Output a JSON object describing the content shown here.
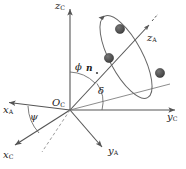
{
  "figure": {
    "kind": "3d-coordinate-frame-diagram",
    "width": 186,
    "height": 169,
    "background": "#ffffff",
    "line_color": "#555555",
    "text_color": "#1a1a1a",
    "sphere_color": "#4d4d4d"
  },
  "origin": {
    "label": "O",
    "subscript": "C",
    "x": 70,
    "y": 110
  },
  "axes": [
    {
      "id": "zc",
      "label": "z",
      "subscript": "C",
      "label_x": 56,
      "label_y": 2,
      "from": [
        70,
        110
      ],
      "to": [
        70,
        6
      ],
      "arrow": true,
      "dashed": false
    },
    {
      "id": "yc",
      "label": "y",
      "subscript": "C",
      "label_x": 167,
      "label_y": 114,
      "from": [
        70,
        110
      ],
      "to": [
        178,
        110
      ],
      "arrow": true,
      "dashed": false
    },
    {
      "id": "xc",
      "label": "x",
      "subscript": "C",
      "label_x": 4,
      "label_y": 154,
      "from": [
        70,
        110
      ],
      "to": [
        12,
        147
      ],
      "arrow": true,
      "dashed": false
    },
    {
      "id": "xa",
      "label": "x",
      "subscript": "A",
      "label_x": 3,
      "label_y": 110,
      "from": [
        70,
        110
      ],
      "to": [
        6,
        102
      ],
      "arrow": true,
      "dashed": false
    },
    {
      "id": "ya",
      "label": "y",
      "subscript": "A",
      "label_x": 110,
      "label_y": 150,
      "from": [
        70,
        110
      ],
      "to": [
        105,
        150
      ],
      "arrow": true,
      "dashed": false
    },
    {
      "id": "za",
      "label": "z",
      "subscript": "A",
      "label_x": 146,
      "label_y": 36,
      "from": [
        70,
        110
      ],
      "to": [
        152,
        22
      ],
      "arrow": true,
      "dashed": false
    }
  ],
  "construction_lines": [
    {
      "id": "projection-ray",
      "from": [
        70,
        110
      ],
      "to": [
        168,
        85
      ]
    },
    {
      "id": "dashed-helper",
      "from": [
        70,
        110
      ],
      "to": [
        40,
        155
      ],
      "dashed": true
    }
  ],
  "angles": [
    {
      "id": "phi",
      "label": "ϕ",
      "label_x": 76,
      "label_y": 66,
      "description": "angle between z_C axis and n vector"
    },
    {
      "id": "delta",
      "label": "δ",
      "label_x": 98,
      "label_y": 92,
      "description": "angle between y_C axis and projection of n"
    },
    {
      "id": "psi",
      "label": "ψ",
      "label_x": 31,
      "label_y": 116,
      "description": "angle between x_A and x_C axes"
    }
  ],
  "vectors": [
    {
      "id": "n",
      "label": "n",
      "label_x": 88,
      "label_y": 68,
      "description": "orbit normal unit vector"
    }
  ],
  "orbit": {
    "id": "orbit-ellipse",
    "center": [
      126,
      57
    ],
    "rx": 16,
    "ry": 46,
    "rotation_deg": -28,
    "direction_arrow": true
  },
  "spheres": [
    {
      "id": "satellite-1",
      "cx": 120,
      "cy": 29,
      "r": 4.6
    },
    {
      "id": "satellite-2",
      "cx": 109,
      "cy": 58,
      "r": 4.6
    },
    {
      "id": "satellite-3",
      "cx": 160,
      "cy": 73,
      "r": 4.6
    }
  ]
}
